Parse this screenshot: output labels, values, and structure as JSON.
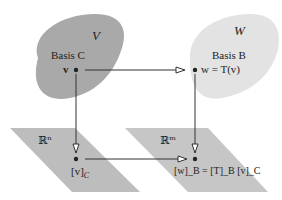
{
  "spaces": {
    "V": {
      "symbol": "V",
      "basis_label": "Basis C",
      "point_label": "v",
      "fill": "#a9a9a9"
    },
    "W": {
      "symbol": "W",
      "basis_label": "Basis B",
      "point_label": "w = T(v)",
      "fill": "#e2e2e2"
    }
  },
  "coordinate_spaces": {
    "Rn": {
      "symbol": "ℝⁿ",
      "point_label": "[v]_C",
      "point_main": "[v]",
      "point_sub": "C",
      "fill": "#bdbdbd"
    },
    "Rm": {
      "symbol": "ℝᵐ",
      "point_label": "[w]_B = [T]_B [v]_C",
      "fill": "#c4c4c4"
    }
  },
  "arrows": [
    {
      "from": "v",
      "to": "w",
      "meaning": "T"
    },
    {
      "from": "v",
      "to": "[v]_C",
      "meaning": "coordinate map C"
    },
    {
      "from": "w",
      "to": "[w]_B",
      "meaning": "coordinate map B"
    },
    {
      "from": "[v]_C",
      "to": "[w]_B",
      "meaning": "[T]_B"
    }
  ],
  "colors": {
    "line": "#333333",
    "text": "#222222"
  }
}
